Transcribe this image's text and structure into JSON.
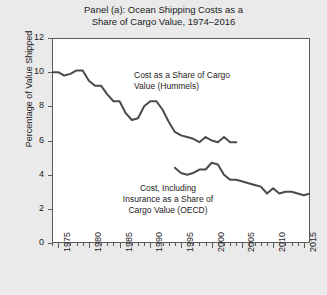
{
  "chart_data": {
    "type": "line",
    "title": "Panel (a): Ocean Shipping Costs as a\nShare of Cargo Value, 1974–2016",
    "xlabel": "",
    "ylabel": "Percentage of Value Shipped",
    "xlim": [
      1974,
      2016
    ],
    "ylim": [
      0,
      12
    ],
    "yticks": [
      0,
      2,
      4,
      6,
      8,
      10,
      12
    ],
    "ytick_labels": [
      "0",
      "2",
      "4",
      "6",
      "8",
      "10",
      "12"
    ],
    "xticks": [
      1975,
      1980,
      1985,
      1990,
      1995,
      2000,
      2005,
      2010,
      2015
    ],
    "xtick_labels": [
      "1975",
      "1980",
      "1985",
      "1990",
      "1995",
      "2000",
      "2005",
      "2010",
      "2015"
    ],
    "minor_xticks_every": 1,
    "grid": false,
    "legend_position": "inline-annotations",
    "line_color": "#4a4a4a",
    "background_color": "#eaeaea",
    "plot_background_color": "#ffffff",
    "series": [
      {
        "name": "Cost as a Share of Cargo Value (Hummels)",
        "annotation": "Cost as a Share of Cargo\nValue (Hummels)",
        "x": [
          1974,
          1975,
          1976,
          1977,
          1978,
          1979,
          1980,
          1981,
          1982,
          1983,
          1984,
          1985,
          1986,
          1987,
          1988,
          1989,
          1990,
          1991,
          1992,
          1993,
          1994,
          1995,
          1996,
          1997,
          1998,
          1999,
          2000,
          2001,
          2002,
          2003,
          2004
        ],
        "values": [
          10.0,
          10.0,
          9.8,
          9.9,
          10.1,
          10.1,
          9.5,
          9.2,
          9.2,
          8.7,
          8.3,
          8.3,
          7.6,
          7.2,
          7.3,
          8.0,
          8.3,
          8.3,
          7.8,
          7.1,
          6.5,
          6.3,
          6.2,
          6.1,
          5.9,
          6.2,
          6.0,
          5.9,
          6.2,
          5.9,
          5.9
        ]
      },
      {
        "name": "Cost, Including Insurance as a Share of Cargo Value (OECD)",
        "annotation": "Cost, Including\nInsurance as a Share of\nCargo Value (OECD)",
        "x": [
          1994,
          1995,
          1996,
          1997,
          1998,
          1999,
          2000,
          2001,
          2002,
          2003,
          2004,
          2005,
          2006,
          2007,
          2008,
          2009,
          2010,
          2011,
          2012,
          2013,
          2014,
          2015,
          2016
        ],
        "values": [
          4.4,
          4.1,
          4.0,
          4.1,
          4.3,
          4.3,
          4.7,
          4.6,
          4.0,
          3.7,
          3.7,
          3.6,
          3.5,
          3.4,
          3.3,
          2.9,
          3.2,
          2.9,
          3.0,
          3.0,
          2.9,
          2.8,
          2.9
        ]
      }
    ]
  }
}
